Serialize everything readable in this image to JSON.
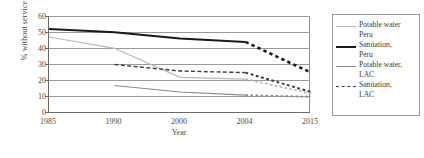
{
  "chart_data": {
    "type": "line",
    "title": "",
    "xlabel": "Year",
    "ylabel": "% without service",
    "ylim": [
      0,
      60
    ],
    "yticks": [
      0,
      10,
      20,
      30,
      40,
      50,
      60
    ],
    "categories": [
      "1985",
      "1990",
      "2000",
      "2004",
      "2015"
    ],
    "grid": "horizontal",
    "legend_position": "right-outside",
    "note": "Segments from 2004 to 2015 are drawn dotted/dashed to indicate projection",
    "series": [
      {
        "name": "Potable water Peru",
        "key": "potable_water_peru",
        "color": "#b9b9b9",
        "style": "solid",
        "width": 1.2,
        "x": [
          "1985",
          "1990",
          "2000",
          "2004",
          "2015"
        ],
        "values": [
          47,
          40,
          22,
          21,
          12
        ],
        "projection_from": "2004"
      },
      {
        "name": "Sanitation, Peru",
        "key": "sanitation_peru",
        "color": "#1a1a1a",
        "style": "solid",
        "width": 2.0,
        "x": [
          "1985",
          "1990",
          "2000",
          "2004",
          "2015"
        ],
        "values": [
          52,
          50,
          46,
          44,
          25
        ],
        "projection_from": "2004"
      },
      {
        "name": "Potable water, LAC",
        "key": "potable_water_lac",
        "color": "#8a8a8a",
        "style": "solid",
        "width": 1.2,
        "x": [
          "1990",
          "2000",
          "2004",
          "2015"
        ],
        "values": [
          17,
          13,
          11,
          10
        ],
        "projection_from": "2004"
      },
      {
        "name": "Sanitation, LAC",
        "key": "sanitation_lac",
        "color": "#3c3c3c",
        "style": "dashed",
        "width": 1.4,
        "x": [
          "1990",
          "2000",
          "2004",
          "2015"
        ],
        "values": [
          30,
          26,
          25,
          13
        ],
        "projection_from": "2004"
      }
    ]
  },
  "axes": {
    "ylabel": "% without service",
    "xlabel": "Year",
    "yticks": [
      "60",
      "50",
      "40",
      "30",
      "20",
      "10",
      "0"
    ],
    "xticks": [
      "1985",
      "1990",
      "2000",
      "2004",
      "2015"
    ]
  },
  "legend": {
    "items": [
      {
        "label_line1": "Potable water",
        "label_line2": "Peru"
      },
      {
        "label_line1": "Sanitation,",
        "label_line2": "Peru"
      },
      {
        "label_line1": "Potable water,",
        "label_line2": "LAC"
      },
      {
        "label_line1": "Sanitation,",
        "label_line2": "LAC"
      }
    ]
  }
}
